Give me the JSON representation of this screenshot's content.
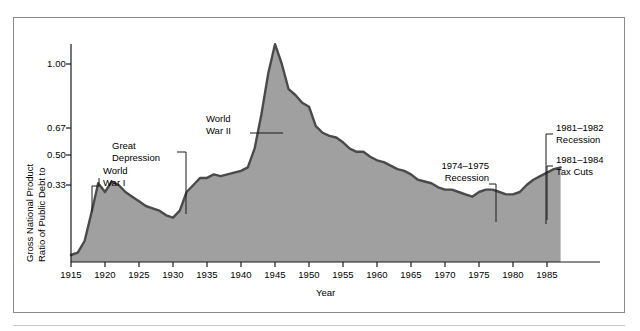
{
  "chart_data": {
    "type": "area",
    "title": "",
    "xlabel": "Year",
    "ylabel": "Ratio of Public Debt to Gross National Product",
    "xlim": [
      1915,
      1987
    ],
    "ylim": [
      0.0,
      1.15
    ],
    "grid": false,
    "legend": "none",
    "xticks": [
      "1915",
      "1920",
      "1925",
      "1930",
      "1935",
      "1940",
      "1945",
      "1950",
      "1955",
      "1960",
      "1965",
      "1970",
      "1975",
      "1980",
      "1985"
    ],
    "yticks": [
      "1.00",
      "0.67",
      "0.50",
      "0.33"
    ],
    "ytick_values": [
      1.0,
      0.67,
      0.5,
      0.33
    ],
    "fill_color": "#a0a0a0",
    "line_color": "#4a4a4a",
    "x": [
      1915,
      1916,
      1917,
      1918,
      1919,
      1920,
      1921,
      1922,
      1923,
      1924,
      1925,
      1926,
      1927,
      1928,
      1929,
      1930,
      1931,
      1932,
      1933,
      1934,
      1935,
      1936,
      1937,
      1938,
      1939,
      1940,
      1941,
      1942,
      1943,
      1944,
      1945,
      1946,
      1947,
      1948,
      1949,
      1950,
      1951,
      1952,
      1953,
      1954,
      1955,
      1956,
      1957,
      1958,
      1959,
      1960,
      1961,
      1962,
      1963,
      1964,
      1965,
      1966,
      1967,
      1968,
      1969,
      1970,
      1971,
      1972,
      1973,
      1974,
      1975,
      1976,
      1977,
      1978,
      1979,
      1980,
      1981,
      1982,
      1983,
      1984,
      1985,
      1986,
      1987
    ],
    "values": [
      0.03,
      0.04,
      0.09,
      0.21,
      0.34,
      0.3,
      0.35,
      0.33,
      0.3,
      0.28,
      0.26,
      0.24,
      0.23,
      0.22,
      0.2,
      0.19,
      0.22,
      0.3,
      0.33,
      0.37,
      0.37,
      0.39,
      0.38,
      0.39,
      0.4,
      0.41,
      0.43,
      0.54,
      0.74,
      0.95,
      1.09,
      1.0,
      0.87,
      0.84,
      0.8,
      0.78,
      0.68,
      0.64,
      0.62,
      0.61,
      0.58,
      0.54,
      0.52,
      0.52,
      0.49,
      0.47,
      0.46,
      0.44,
      0.42,
      0.41,
      0.39,
      0.36,
      0.35,
      0.34,
      0.32,
      0.31,
      0.31,
      0.3,
      0.29,
      0.28,
      0.3,
      0.31,
      0.31,
      0.3,
      0.29,
      0.29,
      0.3,
      0.33,
      0.36,
      0.38,
      0.4,
      0.42,
      0.43
    ]
  },
  "annotations": [
    {
      "id": "world-war-i",
      "lines": [
        "World",
        "War I"
      ]
    },
    {
      "id": "great-depression",
      "lines": [
        "Great",
        "Depression"
      ]
    },
    {
      "id": "world-war-ii",
      "lines": [
        "World",
        "War II"
      ]
    },
    {
      "id": "recession-1974-1975",
      "lines": [
        "1974–1975",
        "Recession"
      ]
    },
    {
      "id": "recession-1981-1982",
      "lines": [
        "1981–1982",
        "Recession"
      ]
    },
    {
      "id": "tax-cuts-1981-1984",
      "lines": [
        "1981–1984",
        "Tax Cuts"
      ]
    }
  ],
  "axis": {
    "x_title": "Year",
    "y_title_line1": "Ratio of Public Debt to",
    "y_title_line2": "Gross National Product"
  }
}
